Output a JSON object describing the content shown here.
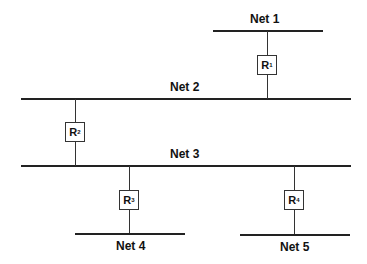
{
  "diagram": {
    "nets": [
      {
        "label": "Net 1"
      },
      {
        "label": "Net 2"
      },
      {
        "label": "Net 3"
      },
      {
        "label": "Net 4"
      },
      {
        "label": "Net 5"
      }
    ],
    "routers": [
      {
        "letter": "R",
        "sub": "1",
        "connects": [
          "Net 1",
          "Net 2"
        ]
      },
      {
        "letter": "R",
        "sub": "2",
        "connects": [
          "Net 2",
          "Net 3"
        ]
      },
      {
        "letter": "R",
        "sub": "3",
        "connects": [
          "Net 3",
          "Net 4"
        ]
      },
      {
        "letter": "R",
        "sub": "4",
        "connects": [
          "Net 3",
          "Net 5"
        ]
      }
    ]
  }
}
